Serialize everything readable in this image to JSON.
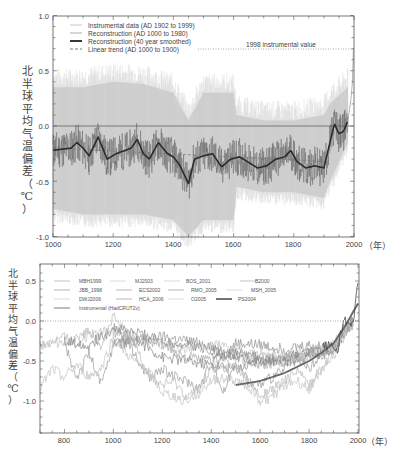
{
  "chart_data": [
    {
      "type": "line",
      "title": "",
      "xlabel": "（年）",
      "ylabel": "北半球平均气温偏差（℃）",
      "xlim": [
        1000,
        2000
      ],
      "ylim": [
        -1.0,
        1.0
      ],
      "xticks": [
        1000,
        1200,
        1400,
        1600,
        1800,
        2000
      ],
      "xtick_labels": [
        "1000",
        "1200",
        "1400",
        "1600",
        "1800",
        "2000"
      ],
      "yticks": [
        -1.0,
        -0.5,
        0.0,
        0.5,
        1.0
      ],
      "ytick_labels": [
        "-1.0",
        "-0.5",
        "0.0",
        "0.5",
        "1.0"
      ],
      "grid": false,
      "legend_position": "upper left",
      "legend": [
        "Instrumental data (AD 1902 to 1999)",
        "Reconstruction (AD 1000 to 1980)",
        "Reconstruction (40 year smoothed)",
        "Linear trend (AD 1000 to 1900)"
      ],
      "annotations": [
        {
          "text": "1998 instrumental value",
          "y": 0.7
        }
      ],
      "uncertainty_band": {
        "x": [
          1000,
          1100,
          1200,
          1300,
          1400,
          1450,
          1500,
          1600,
          1610,
          1700,
          1800,
          1900,
          1920,
          1980
        ],
        "upper": [
          0.35,
          0.35,
          0.4,
          0.38,
          0.3,
          0.05,
          0.3,
          0.3,
          0.1,
          0.05,
          0.05,
          0.1,
          0.2,
          0.35
        ],
        "lower": [
          -0.75,
          -0.8,
          -0.8,
          -0.8,
          -0.85,
          -1.0,
          -0.85,
          -0.85,
          -0.55,
          -0.6,
          -0.6,
          -0.65,
          -0.5,
          -0.15
        ]
      },
      "series": [
        {
          "name": "Reconstruction (40 year smoothed)",
          "x": [
            1000,
            1030,
            1060,
            1080,
            1100,
            1120,
            1150,
            1180,
            1210,
            1240,
            1260,
            1280,
            1300,
            1320,
            1350,
            1380,
            1400,
            1420,
            1450,
            1470,
            1500,
            1530,
            1560,
            1590,
            1620,
            1650,
            1680,
            1710,
            1740,
            1770,
            1790,
            1810,
            1840,
            1870,
            1900,
            1920,
            1935,
            1950,
            1965,
            1980
          ],
          "values": [
            -0.22,
            -0.21,
            -0.2,
            -0.15,
            -0.2,
            -0.27,
            -0.1,
            -0.3,
            -0.25,
            -0.22,
            -0.2,
            -0.12,
            -0.25,
            -0.3,
            -0.15,
            -0.25,
            -0.28,
            -0.35,
            -0.52,
            -0.3,
            -0.27,
            -0.25,
            -0.37,
            -0.3,
            -0.28,
            -0.33,
            -0.38,
            -0.36,
            -0.3,
            -0.28,
            -0.22,
            -0.32,
            -0.38,
            -0.36,
            -0.38,
            -0.15,
            0.02,
            -0.07,
            -0.05,
            0.05
          ]
        },
        {
          "name": "Linear trend (AD 1000 to 1900)",
          "x": [
            1000,
            1900
          ],
          "values": [
            -0.2,
            -0.32
          ]
        },
        {
          "name": "Instrumental data (AD 1902 to 1999)",
          "x": [
            1902,
            1920,
            1940,
            1950,
            1960,
            1975,
            1985,
            1990,
            1995,
            1998
          ],
          "values": [
            -0.3,
            -0.25,
            0.0,
            -0.05,
            -0.02,
            -0.05,
            0.15,
            0.25,
            0.4,
            0.7
          ]
        }
      ]
    },
    {
      "type": "line",
      "title": "",
      "xlabel": "（年）",
      "ylabel": "北半球平均气温偏差（℃）",
      "xlim": [
        700,
        2000
      ],
      "ylim": [
        -1.4,
        0.65
      ],
      "xticks": [
        800,
        1000,
        1200,
        1400,
        1600,
        1800,
        2000
      ],
      "xtick_labels": [
        "800",
        "1000",
        "1200",
        "1400",
        "1600",
        "1800",
        "2000"
      ],
      "yticks": [
        -1.0,
        -0.5,
        0.0,
        0.5
      ],
      "ytick_labels": [
        "-1.0",
        "-0.5",
        "0.0",
        "0.5"
      ],
      "grid": false,
      "legend_position": "upper left",
      "legend": [
        "MBH1999",
        "MJ2003",
        "BOS_2001",
        "B2000",
        "JBB_1998",
        "ECS2002",
        "RMO_2005",
        "MSH_2005",
        "DWJ2006",
        "HCA_2006",
        "O2005",
        "PS2004",
        "Instrumental (HadCRUT2v)"
      ],
      "series": [
        {
          "name": "MBH1999",
          "x": [
            1000,
            1100,
            1200,
            1300,
            1400,
            1450,
            1500,
            1600,
            1700,
            1800,
            1900,
            1950,
            1980
          ],
          "values": [
            -0.2,
            -0.25,
            -0.2,
            -0.25,
            -0.3,
            -0.45,
            -0.28,
            -0.3,
            -0.35,
            -0.3,
            -0.35,
            -0.05,
            0.05
          ]
        },
        {
          "name": "MJ2003",
          "x": [
            200,
            700,
            800,
            900,
            1000,
            1100,
            1200,
            1300,
            1400,
            1500,
            1600,
            1700,
            1800,
            1900,
            1950,
            1980
          ],
          "values": [
            -0.3,
            -0.3,
            -0.25,
            -0.2,
            -0.1,
            -0.2,
            -0.3,
            -0.35,
            -0.3,
            -0.35,
            -0.45,
            -0.45,
            -0.35,
            -0.3,
            -0.05,
            0.0
          ]
        },
        {
          "name": "BOS_2001",
          "x": [
            1400,
            1500,
            1600,
            1700,
            1800,
            1900,
            1960
          ],
          "values": [
            -0.5,
            -0.45,
            -0.55,
            -0.5,
            -0.45,
            -0.3,
            -0.05
          ]
        },
        {
          "name": "B2000",
          "x": [
            1000,
            1100,
            1200,
            1300,
            1400,
            1500,
            1600,
            1700,
            1800,
            1900,
            1980
          ],
          "values": [
            -0.15,
            -0.2,
            -0.3,
            -0.45,
            -0.5,
            -0.4,
            -0.55,
            -0.5,
            -0.4,
            -0.3,
            0.0
          ]
        },
        {
          "name": "JBB_1998",
          "x": [
            1000,
            1100,
            1200,
            1300,
            1400,
            1500,
            1600,
            1700,
            1800,
            1900,
            1980
          ],
          "values": [
            -0.3,
            -0.25,
            -0.45,
            -0.5,
            -0.55,
            -0.6,
            -0.5,
            -0.45,
            -0.4,
            -0.35,
            0.0
          ]
        },
        {
          "name": "ECS2002",
          "x": [
            800,
            850,
            900,
            950,
            1000,
            1050,
            1100,
            1150,
            1200,
            1250,
            1300,
            1350,
            1400,
            1450,
            1500,
            1550,
            1600,
            1650,
            1700,
            1750,
            1800,
            1850,
            1900,
            1950,
            1980
          ],
          "values": [
            -0.3,
            -0.7,
            -0.4,
            -0.8,
            -0.3,
            -0.2,
            -0.5,
            -0.7,
            -0.6,
            -0.7,
            -0.75,
            -0.85,
            -0.5,
            -0.9,
            -0.5,
            -0.75,
            -0.8,
            -0.7,
            -0.6,
            -0.5,
            -0.6,
            -0.45,
            -0.35,
            -0.1,
            -0.05
          ]
        },
        {
          "name": "RMO_2005",
          "x": [
            1400,
            1500,
            1600,
            1700,
            1800,
            1900,
            1980
          ],
          "values": [
            -0.4,
            -0.45,
            -0.5,
            -0.5,
            -0.45,
            -0.35,
            0.0
          ]
        },
        {
          "name": "MSH_2005",
          "x": [
            700,
            800,
            850,
            900,
            950,
            1000,
            1050,
            1100,
            1150,
            1200,
            1250,
            1300,
            1350,
            1400,
            1450,
            1500,
            1550,
            1600,
            1650,
            1700,
            1750,
            1800,
            1850,
            1900,
            1950,
            1980
          ],
          "values": [
            -0.3,
            -0.2,
            -0.3,
            -0.1,
            -0.3,
            0.05,
            -0.15,
            -0.35,
            -0.7,
            -0.8,
            -0.75,
            -0.95,
            -0.85,
            -0.6,
            -0.6,
            -0.55,
            -0.75,
            -0.95,
            -0.85,
            -0.75,
            -0.6,
            -0.8,
            -0.6,
            -0.35,
            -0.1,
            0.1
          ]
        },
        {
          "name": "DWJ2006",
          "x": [
            700,
            750,
            800,
            850,
            900,
            950,
            1000,
            1050,
            1100,
            1150,
            1200,
            1250,
            1300,
            1350,
            1400,
            1450,
            1500,
            1550,
            1600,
            1650,
            1700,
            1750,
            1800,
            1850,
            1900,
            1950,
            1980
          ],
          "values": [
            -0.85,
            -0.6,
            -0.7,
            -0.55,
            -0.7,
            -0.6,
            -0.2,
            -0.4,
            -0.55,
            -0.65,
            -0.9,
            -0.95,
            -1.0,
            -0.9,
            -0.75,
            -0.7,
            -0.75,
            -0.8,
            -1.0,
            -0.95,
            -0.8,
            -0.75,
            -0.85,
            -0.6,
            -0.45,
            -0.15,
            -0.05
          ]
        },
        {
          "name": "HCA_2006",
          "x": [
            800,
            900,
            1000,
            1100,
            1200,
            1300,
            1400,
            1500,
            1600,
            1700,
            1800,
            1900,
            1980
          ],
          "values": [
            -0.25,
            -0.3,
            -0.1,
            -0.15,
            -0.25,
            -0.3,
            -0.35,
            -0.4,
            -0.45,
            -0.5,
            -0.4,
            -0.35,
            0.0
          ]
        },
        {
          "name": "O2005",
          "x": [
            1600,
            1700,
            1800,
            1900,
            1980
          ],
          "values": [
            -0.4,
            -0.45,
            -0.45,
            -0.3,
            0.0
          ]
        },
        {
          "name": "PS2004",
          "x": [
            1500,
            1600,
            1700,
            1800,
            1850,
            1900,
            1950,
            2000
          ],
          "values": [
            -0.8,
            -0.75,
            -0.65,
            -0.5,
            -0.4,
            -0.28,
            -0.05,
            0.22
          ]
        },
        {
          "name": "Instrumental (HadCRUT2v)",
          "x": [
            1856,
            1880,
            1900,
            1910,
            1920,
            1940,
            1950,
            1960,
            1975,
            1990,
            2000
          ],
          "values": [
            -0.3,
            -0.3,
            -0.35,
            -0.4,
            -0.3,
            0.0,
            -0.02,
            -0.05,
            -0.1,
            0.2,
            0.5
          ]
        }
      ]
    }
  ],
  "top_chart": {
    "legend": {
      "item0": "Instrumental data (AD 1902 to 1999)",
      "item1": "Reconstruction (AD 1000 to 1980)",
      "item2": "Reconstruction (40 year smoothed)",
      "item3": "Linear trend (AD 1000 to 1900)"
    },
    "annotation": "1998 instrumental value",
    "ylabel_chars": [
      "北",
      "半",
      "球",
      "平",
      "均",
      "气",
      "温",
      "偏",
      "差",
      "（",
      "℃",
      "）"
    ],
    "yticks": {
      "t0": "1.0",
      "t1": "0.5",
      "t2": "0.0",
      "t3": "-0.5",
      "t4": "-1.0"
    },
    "xticks": {
      "t0": "1000",
      "t1": "1200",
      "t2": "1400",
      "t3": "1600",
      "t4": "1800",
      "t5": "2000"
    },
    "xunit": "（年）"
  },
  "bottom_chart": {
    "legend": {
      "r0c0": "MBH1999",
      "r0c1": "MJ2003",
      "r0c2": "BOS_2001",
      "r0c3": "B2000",
      "r1c0": "JBB_1998",
      "r1c1": "ECS2002",
      "r1c2": "RMO_2005",
      "r1c3": "MSH_2005",
      "r2c0": "DWJ2006",
      "r2c1": "HCA_2006",
      "r2c2": "O2005",
      "r2c3": "PS2004",
      "r3c0": "Instrumental (HadCRUT2v)"
    },
    "yticks": {
      "t0": "0.5",
      "t1": "0.0",
      "t2": "-0.5",
      "t3": "-1.0"
    },
    "xticks": {
      "t0": "800",
      "t1": "1000",
      "t2": "1200",
      "t3": "1400",
      "t4": "1600",
      "t5": "1800",
      "t6": "2000"
    },
    "xunit": "（年）"
  },
  "colors": {
    "band": "#b4b4b4",
    "band_light": "#d8d8d8",
    "reconstruction": "#555555",
    "smoothed": "#2b2b2b",
    "frame": "#555555",
    "text": "#444444"
  }
}
